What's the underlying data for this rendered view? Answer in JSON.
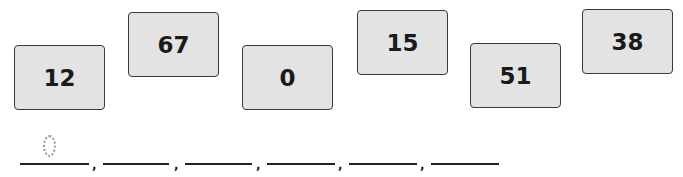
{
  "cards": [
    {
      "value": "12"
    },
    {
      "value": "67"
    },
    {
      "value": "0"
    },
    {
      "value": "15"
    },
    {
      "value": "51"
    },
    {
      "value": "38"
    }
  ],
  "answer": {
    "blank_count": 6,
    "separator": ",",
    "first_answer_traced": "0"
  }
}
